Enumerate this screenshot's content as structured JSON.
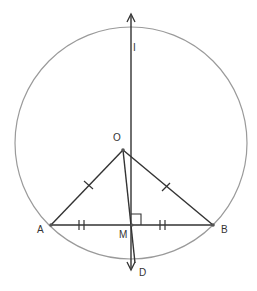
{
  "diagram": {
    "type": "geometry-construction",
    "colors": {
      "circle": "#9a9a9a",
      "lines": "#333333",
      "labels": "#333333"
    },
    "points": {
      "O": {
        "label": "O",
        "x": 123,
        "y": 150
      },
      "A": {
        "label": "A",
        "x": 51,
        "y": 225
      },
      "B": {
        "label": "B",
        "x": 213,
        "y": 225
      },
      "M": {
        "label": "M",
        "x": 132,
        "y": 225
      },
      "D": {
        "label": "D",
        "x": 135,
        "y": 263
      },
      "I": {
        "label": "I"
      }
    },
    "circle": {
      "cx": 131,
      "cy": 143,
      "r": 116
    },
    "marks": {
      "OA_OB": "single tick (equal segments)",
      "AM_MB": "double tick (equal segments)",
      "right_angle": "at M between line IM and segment MB"
    },
    "lines": [
      {
        "name": "perpendicular-bisector",
        "from": "bottom arrow",
        "to": "top arrow",
        "through": [
          "I",
          "M"
        ]
      },
      {
        "name": "OA"
      },
      {
        "name": "OB"
      },
      {
        "name": "AB"
      },
      {
        "name": "OD",
        "arrow": true
      }
    ]
  }
}
